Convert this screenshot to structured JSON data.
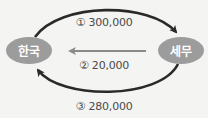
{
  "diagram": {
    "nodes": [
      {
        "id": "korea",
        "label": "한국",
        "color": "#9c9c9c"
      },
      {
        "id": "semu",
        "label": "세무",
        "color": "#9c9c9c"
      }
    ],
    "flows": [
      {
        "step": "①",
        "from": "한국",
        "to": "세무",
        "value": "300,000",
        "label": "① 300,000",
        "style": "top-arc",
        "color": "#2a2a2a"
      },
      {
        "step": "②",
        "from": "세무",
        "to": "한국",
        "value": "20,000",
        "label": "② 20,000",
        "style": "straight",
        "color": "#8a8a8a"
      },
      {
        "step": "③",
        "from": "세무",
        "to": "한국",
        "value": "280,000",
        "label": "③ 280,000",
        "style": "bottom-arc",
        "color": "#2a2a2a"
      }
    ],
    "colors": {
      "background": "#f4f4f2",
      "node_fill": "#9c9c9c",
      "node_text": "#ffffff",
      "arc_stroke": "#2a2a2a",
      "middle_arrow": "#8a8a8a",
      "label_text": "#4a4a4a"
    }
  }
}
